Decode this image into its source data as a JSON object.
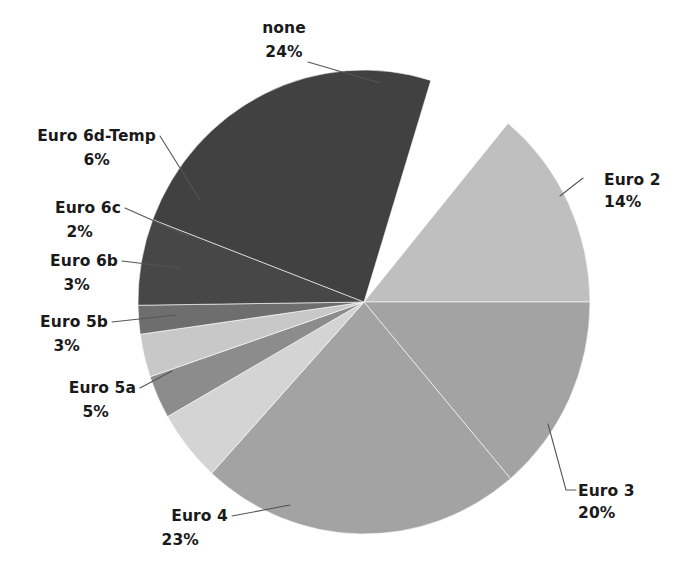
{
  "chart_data": {
    "type": "pie",
    "title": "",
    "subtitle": "",
    "xlabel": "",
    "ylabel": "",
    "legend_position": "none",
    "grid": false,
    "labels_show_percent": true,
    "total_percent": 100,
    "categories": [
      "Euro 2",
      "Euro 3",
      "Euro 4",
      "Euro 5a",
      "Euro 5b",
      "Euro 6b",
      "Euro 6c",
      "Euro 6d-Temp",
      "none"
    ],
    "values": [
      14,
      20,
      23,
      5,
      3,
      3,
      2,
      6,
      24
    ],
    "slices": [
      {
        "name": "Euro 2",
        "percent": 14,
        "value_label": "14%",
        "color": "#bfbfbf",
        "start_angle": 0,
        "end_angle": 50.4,
        "label_x": 604,
        "label_y": 185,
        "pct_x": 604,
        "pct_y": 207,
        "label_anchor": "start",
        "leader": "M 560,196 L 583,178"
      },
      {
        "name": "Euro 3",
        "percent": 20,
        "value_label": "20%",
        "color": "#a3a3a3",
        "start_angle": 310.4,
        "end_angle": 360,
        "label_x": 578,
        "label_y": 496,
        "pct_x": 578,
        "pct_y": 518,
        "label_anchor": "start",
        "leader": "M 548,424 L 566,490 L 576,490"
      },
      {
        "name": "Euro 4",
        "percent": 23,
        "value_label": "23%",
        "color": "#a3a3a3",
        "start_angle": 227.6,
        "end_angle": 310.4,
        "label_x": 228,
        "label_y": 521,
        "pct_x": 199,
        "pct_y": 545,
        "label_anchor": "end",
        "leader": "M 232,516 L 290,505"
      },
      {
        "name": "Euro 5a",
        "percent": 5,
        "value_label": "5%",
        "color": "#d4d4d4",
        "start_angle": 209.6,
        "end_angle": 227.6,
        "label_x": 136,
        "label_y": 393,
        "pct_x": 109,
        "pct_y": 417,
        "label_anchor": "end",
        "leader": "M 140,388 L 172,371"
      },
      {
        "name": "Euro 5b",
        "percent": 3,
        "value_label": "3%",
        "color": "#8c8c8c",
        "start_angle": 198.8,
        "end_angle": 209.6,
        "label_x": 108,
        "label_y": 327,
        "pct_x": 80,
        "pct_y": 351,
        "label_anchor": "end",
        "leader": "M 112,322 L 176,315"
      },
      {
        "name": "Euro 6b",
        "percent": 3,
        "value_label": "3%",
        "color": "#c8c8c8",
        "start_angle": 188,
        "end_angle": 198.8,
        "label_x": 118,
        "label_y": 266,
        "pct_x": 90,
        "pct_y": 290,
        "label_anchor": "end",
        "leader": "M 122,261 L 180,268"
      },
      {
        "name": "Euro 6c",
        "percent": 2,
        "value_label": "2%",
        "color": "#6e6e6e",
        "start_angle": 180.8,
        "end_angle": 188,
        "label_x": 121,
        "label_y": 213,
        "pct_x": 93,
        "pct_y": 237,
        "label_anchor": "end",
        "leader": "M 125,208 L 188,236"
      },
      {
        "name": "Euro 6d-Temp",
        "percent": 6,
        "value_label": "6%",
        "color": "#474747",
        "start_angle": 159.2,
        "end_angle": 180.8,
        "label_x": 156,
        "label_y": 141,
        "pct_x": 110,
        "pct_y": 165,
        "label_anchor": "end",
        "leader": "M 160,136 L 200,200"
      },
      {
        "name": "none",
        "percent": 24,
        "value_label": "24%",
        "color": "#414141",
        "start_angle": 72.8,
        "end_angle": 159.2,
        "label_x": 284,
        "label_y": 33,
        "pct_x": 284,
        "pct_y": 57,
        "label_anchor": "middle",
        "leader": "M 308,62 L 380,83"
      }
    ],
    "geometry": {
      "center_x": 364,
      "center_y": 302,
      "radius_x": 226,
      "radius_y": 232,
      "rotation_note": "angles measured counter-clockwise from 3 o'clock"
    },
    "palette": {
      "background": "#ffffff",
      "text": "#1a1a1a",
      "leader_line": "#555555",
      "slice_border": "#ffffff"
    }
  }
}
